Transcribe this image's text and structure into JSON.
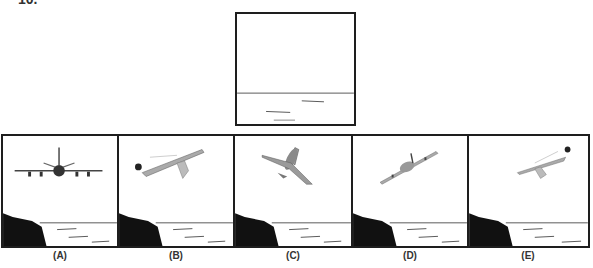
{
  "question": {
    "number_label": "10."
  },
  "question_figure": {
    "description": "Blank sky above horizon line with sea ripples",
    "scene": "empty-sea-horizon"
  },
  "options": [
    {
      "label": "(A)",
      "scene": "plane-front-view-level"
    },
    {
      "label": "(B)",
      "scene": "plane-side-view-climbing-left-with-sun"
    },
    {
      "label": "(C)",
      "scene": "plane-top-view-diving-right"
    },
    {
      "label": "(D)",
      "scene": "plane-rear-view-banking-left"
    },
    {
      "label": "(E)",
      "scene": "plane-side-view-climbing-right-with-sun"
    }
  ],
  "colors": {
    "border": "#1e1e1e",
    "cliff": "#111111",
    "horizon": "#555555",
    "plane_body": "#9a9a9a",
    "plane_shadow": "#555555"
  }
}
